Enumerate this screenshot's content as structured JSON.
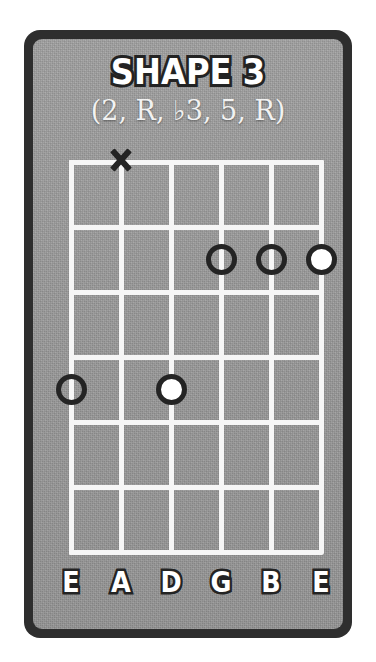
{
  "card": {
    "title": "SHAPE 3",
    "subtitle": "(2, R, ♭3, 5, R)",
    "frame_color": "#2e2e2e",
    "panel_color": "#9a9a9a",
    "grid_color": "#f6f6f6",
    "marker_color": "#242424",
    "root_fill_color": "#ffffff"
  },
  "diagram": {
    "type": "guitar-fretboard",
    "string_count": 6,
    "fret_count": 6,
    "strings": [
      {
        "index": 1,
        "label": "E",
        "x": 71
      },
      {
        "index": 2,
        "label": "A",
        "x": 121
      },
      {
        "index": 3,
        "label": "D",
        "x": 171
      },
      {
        "index": 4,
        "label": "G",
        "x": 221
      },
      {
        "index": 5,
        "label": "B",
        "x": 271
      },
      {
        "index": 6,
        "label": "E",
        "x": 321
      }
    ],
    "fret_lines_y": [
      162,
      227,
      292,
      357,
      422,
      487,
      552
    ],
    "markers": [
      {
        "id": "m1",
        "kind": "mute",
        "string": 2,
        "string_label": "A",
        "fret": 0,
        "symbol": "X"
      },
      {
        "id": "m2",
        "kind": "open-dot",
        "string": 4,
        "string_label": "G",
        "fret": 2,
        "degree": "2"
      },
      {
        "id": "m3",
        "kind": "open-dot",
        "string": 5,
        "string_label": "B",
        "fret": 2,
        "degree": "♭3"
      },
      {
        "id": "m4",
        "kind": "filled-dot",
        "string": 6,
        "string_label": "E",
        "fret": 2,
        "degree": "R"
      },
      {
        "id": "m5",
        "kind": "open-dot",
        "string": 1,
        "string_label": "E",
        "fret": 4,
        "degree": "5"
      },
      {
        "id": "m6",
        "kind": "filled-dot",
        "string": 3,
        "string_label": "D",
        "fret": 4,
        "degree": "R"
      }
    ]
  },
  "string_labels": [
    "E",
    "A",
    "D",
    "G",
    "B",
    "E"
  ]
}
